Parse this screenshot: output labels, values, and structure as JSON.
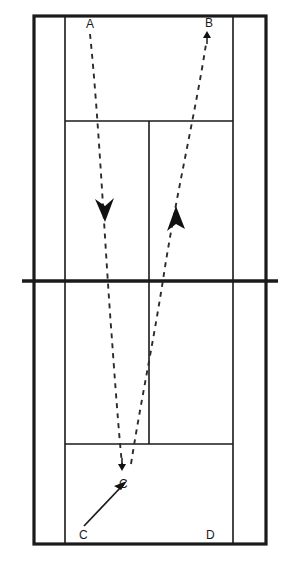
{
  "diagram": {
    "colors": {
      "line": "#1a1a1a",
      "trajectory": "#2b2b2b",
      "background": "#ffffff"
    },
    "court": {
      "outer_left": 34,
      "outer_right": 266,
      "outer_top": 16,
      "outer_bottom": 544,
      "singles_sideline_left": 65,
      "singles_sideline_right": 233,
      "net_y": 281,
      "net_extend_left": 22,
      "net_extend_right": 278,
      "top_service_line_y": 121,
      "bottom_service_line_y": 444,
      "centre_line_x": 149
    },
    "labels": [
      {
        "id": "label-a",
        "text": "A",
        "x": 86,
        "y": 18
      },
      {
        "id": "label-b",
        "text": "B",
        "x": 205,
        "y": 17
      },
      {
        "id": "label-c-landing",
        "text": "C",
        "x": 119,
        "y": 478
      },
      {
        "id": "label-c-origin",
        "text": "C",
        "x": 79,
        "y": 529
      },
      {
        "id": "label-d",
        "text": "D",
        "x": 206,
        "y": 529
      }
    ],
    "trajectories": [
      {
        "id": "shuttle-path-a-to-c",
        "style": "dashed",
        "direction": "downward",
        "from_label": "A",
        "to_label": "C",
        "path": "M 90,34 C 99,120 105,250 112,340 C 117,410 120,445 122,464",
        "midpoint_arrowhead": {
          "x": 104,
          "y": 211,
          "direction": "down"
        },
        "end_arrowhead": {
          "x": 122,
          "y": 468,
          "direction": "down"
        }
      },
      {
        "id": "shuttle-path-c-to-b",
        "style": "dashed",
        "direction": "upward",
        "from_label": "C",
        "to_label": "B",
        "path": "M 131,464 C 141,400 152,350 163,280 C 175,200 196,110 206,44",
        "midpoint_arrowhead": {
          "x": 176,
          "y": 221,
          "direction": "up"
        },
        "end_arrowhead": {
          "x": 207,
          "y": 36,
          "direction": "up"
        }
      },
      {
        "id": "player-move-c",
        "style": "solid",
        "direction": "upward-right",
        "from_label": "C",
        "to_label": "C",
        "path": "M 84,526 L 124,484",
        "end_arrowhead": {
          "x": 126,
          "y": 482,
          "direction": "up-right"
        }
      }
    ]
  }
}
